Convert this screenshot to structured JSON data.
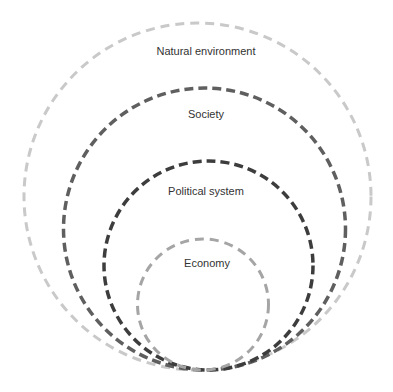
{
  "diagram": {
    "type": "nested-circles",
    "rings": [
      {
        "id": "natural-environment",
        "label": "Natural environment",
        "color": "#c9c9c9",
        "cx": 197.5,
        "cy": 196.5,
        "r": 173.5,
        "stroke_width": 3,
        "dash": "9 6",
        "label_x": 206,
        "label_y": 55
      },
      {
        "id": "society",
        "label": "Society",
        "color": "#5f5f5f",
        "cx": 204.5,
        "cy": 229,
        "r": 141,
        "stroke_width": 3.5,
        "dash": "9 5",
        "label_x": 206,
        "label_y": 118
      },
      {
        "id": "political-system",
        "label": "Political system",
        "color": "#3d3d3d",
        "cx": 208.5,
        "cy": 265.5,
        "r": 104.5,
        "stroke_width": 3.5,
        "dash": "9 5",
        "label_x": 206,
        "label_y": 195
      },
      {
        "id": "economy",
        "label": "Economy",
        "color": "#a5a5a5",
        "cx": 203,
        "cy": 304.5,
        "r": 65.5,
        "stroke_width": 3,
        "dash": "9 6",
        "label_x": 207,
        "label_y": 267
      }
    ]
  }
}
